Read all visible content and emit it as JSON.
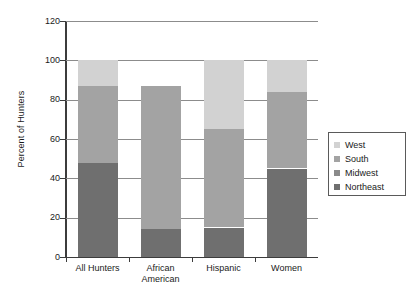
{
  "chart_data": {
    "type": "bar",
    "subtype": "stacked-bar",
    "title": "",
    "xlabel": "",
    "ylabel": "Percent of Hunters",
    "ylim": [
      0,
      120
    ],
    "ytick_step": 20,
    "yticks": [
      "0",
      "20",
      "40",
      "60",
      "80",
      "100",
      "120"
    ],
    "grid": true,
    "legend_position": "right",
    "categories": [
      "All Hunters",
      "African American",
      "Hispanic",
      "Women"
    ],
    "category_lines": [
      [
        "All Hunters"
      ],
      [
        "African",
        "American"
      ],
      [
        "Hispanic"
      ],
      [
        "Women"
      ]
    ],
    "series": [
      {
        "name": "Northeast",
        "color": "#6f6f6f",
        "values": [
          48,
          14,
          15,
          45
        ]
      },
      {
        "name": "Midwest",
        "color": "#8a8a8a",
        "values": [
          0,
          0,
          0,
          0
        ]
      },
      {
        "name": "South",
        "color": "#a3a3a3",
        "values": [
          39,
          73,
          50,
          39
        ]
      },
      {
        "name": "West",
        "color": "#d2d2d2",
        "values": [
          13,
          0,
          35,
          16
        ]
      }
    ],
    "cumulative_tops": {
      "All Hunters": [
        48,
        48,
        87,
        100
      ],
      "African American": [
        14,
        14,
        87,
        87
      ],
      "Hispanic": [
        15,
        15,
        65,
        100
      ],
      "Women": [
        45,
        45,
        84,
        100
      ]
    }
  },
  "legend": {
    "entries": [
      {
        "label": "West",
        "color": "#d2d2d2"
      },
      {
        "label": "South",
        "color": "#a3a3a3"
      },
      {
        "label": "Midwest",
        "color": "#8a8a8a"
      },
      {
        "label": "Northeast",
        "color": "#6f6f6f"
      }
    ]
  }
}
